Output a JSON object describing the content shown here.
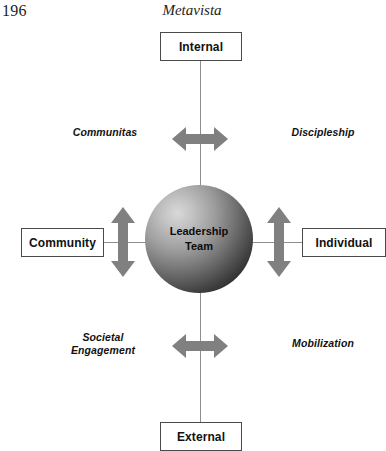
{
  "header": {
    "page_number": "196",
    "book_title": "Metavista"
  },
  "diagram": {
    "center": {
      "label_line1": "Leadership",
      "label_line2": "Team"
    },
    "nodes": {
      "internal": "Internal",
      "external": "External",
      "community": "Community",
      "individual": "Individual"
    },
    "captions": {
      "communitas": "Communitas",
      "discipleship": "Discipleship",
      "societal_line1": "Societal",
      "societal_line2": "Engagement",
      "mobilization": "Mobilization"
    },
    "arrows": {
      "top": "horizontal-double-arrow",
      "bottom": "horizontal-double-arrow",
      "left": "vertical-double-arrow",
      "right": "vertical-double-arrow"
    },
    "colors": {
      "arrow_fill": "#808080",
      "line_stroke": "#8e8e8e",
      "box_border": "#4a4a4a",
      "sphere_light": "#d9d9d9",
      "sphere_dark": "#0d0d0d",
      "text": "#111111"
    }
  }
}
